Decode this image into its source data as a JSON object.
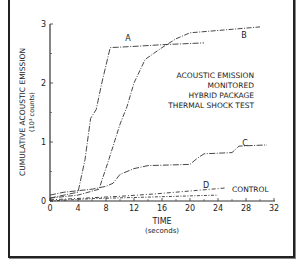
{
  "chart_data": {
    "type": "line",
    "title": "ACOUSTIC EMISSION MONITORED HYBRID PACKAGE THERMAL SHOCK TEST",
    "title_lines": [
      "ACOUSTIC EMISSION",
      "MONITORED",
      "HYBRID PACKAGE",
      "THERMAL SHOCK TEST"
    ],
    "xlabel": "TIME",
    "xlabel_units": "(seconds)",
    "ylabel": "CUMULATIVE ACOUSTIC EMISSION",
    "ylabel_units": "(10³ counts)",
    "xlim": [
      0,
      32
    ],
    "ylim": [
      0,
      3
    ],
    "x_ticks": [
      "0",
      "4",
      "8",
      "12",
      "16",
      "20",
      "24",
      "28",
      "32"
    ],
    "y_ticks": [
      "0",
      "1",
      "2",
      "3"
    ],
    "grid": false,
    "series": [
      {
        "name": "A",
        "points": [
          [
            0,
            0.05
          ],
          [
            2,
            0.1
          ],
          [
            4,
            0.15
          ],
          [
            5,
            0.7
          ],
          [
            5.8,
            1.4
          ],
          [
            6.6,
            1.55
          ],
          [
            7.4,
            2.0
          ],
          [
            8.6,
            2.6
          ],
          [
            12,
            2.62
          ],
          [
            16,
            2.65
          ],
          [
            22,
            2.68
          ]
        ]
      },
      {
        "name": "B",
        "points": [
          [
            0,
            0.05
          ],
          [
            4,
            0.1
          ],
          [
            7,
            0.2
          ],
          [
            8.4,
            0.7
          ],
          [
            10,
            1.3
          ],
          [
            11,
            1.6
          ],
          [
            12,
            2.0
          ],
          [
            13.6,
            2.4
          ],
          [
            16,
            2.6
          ],
          [
            18,
            2.75
          ],
          [
            20,
            2.85
          ],
          [
            25,
            2.9
          ],
          [
            30,
            2.95
          ]
        ]
      },
      {
        "name": "C",
        "points": [
          [
            0,
            0.1
          ],
          [
            2,
            0.15
          ],
          [
            6,
            0.2
          ],
          [
            8,
            0.25
          ],
          [
            9,
            0.3
          ],
          [
            10,
            0.45
          ],
          [
            12,
            0.55
          ],
          [
            14,
            0.6
          ],
          [
            20,
            0.62
          ],
          [
            21,
            0.72
          ],
          [
            22,
            0.8
          ],
          [
            26,
            0.82
          ],
          [
            27,
            0.93
          ],
          [
            31,
            0.95
          ]
        ]
      },
      {
        "name": "D",
        "points": [
          [
            0,
            0.02
          ],
          [
            5,
            0.05
          ],
          [
            10,
            0.08
          ],
          [
            15,
            0.12
          ],
          [
            20,
            0.17
          ],
          [
            25,
            0.22
          ]
        ]
      },
      {
        "name": "CONTROL",
        "points": [
          [
            0,
            0.0
          ],
          [
            6,
            0.04
          ],
          [
            12,
            0.06
          ],
          [
            18,
            0.08
          ],
          [
            24,
            0.1
          ]
        ]
      }
    ],
    "annotations": [
      "A",
      "B",
      "C",
      "D",
      "CONTROL"
    ]
  }
}
